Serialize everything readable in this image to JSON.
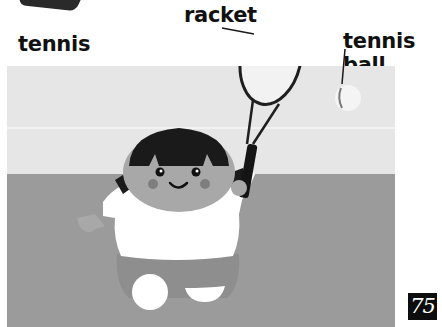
{
  "labels": {
    "scene_title": "tennis",
    "racket": "racket",
    "tennis_ball": "tennis ball"
  },
  "page": {
    "number": "75"
  },
  "colors": {
    "background": "#ffffff",
    "wall": "#e6e6e6",
    "court": "#9b9b9b",
    "hair": "#1a1a1a",
    "skin": "#a8a8a8",
    "shirt": "#ffffff",
    "shorts": "#8e8e8e",
    "page_badge": "#0d0d0d"
  },
  "illustration": {
    "subject": "girl playing tennis",
    "items": [
      "racket",
      "tennis ball"
    ]
  }
}
